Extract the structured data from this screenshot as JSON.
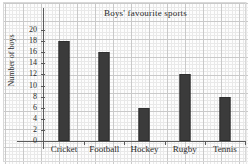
{
  "chart_data": {
    "type": "bar",
    "title": "Boys' favourite sports",
    "xlabel": "",
    "ylabel": "Number of boys",
    "categories": [
      "Cricket",
      "Football",
      "Hockey",
      "Rugby",
      "Tennis"
    ],
    "values": [
      18,
      16,
      6,
      12,
      8
    ],
    "ylim": [
      0,
      20
    ],
    "ytick_step": 2,
    "yticks": [
      0,
      2,
      4,
      6,
      8,
      10,
      12,
      14,
      16,
      18,
      20
    ],
    "ytick_labels": [
      "0",
      "2",
      "4",
      "6",
      "8",
      "10",
      "12",
      "14",
      "16",
      "18",
      "20"
    ],
    "grid": true,
    "grid_style": "graph-paper",
    "legend": false,
    "bar_color": "#3b3b3b",
    "axis_color": "#5a5a5a",
    "grid_color_major": "#c9c9c9",
    "grid_color_minor": "#e9e9e9",
    "background": "#fdfdfd",
    "series": [
      {
        "name": "Number of boys",
        "values": [
          18,
          16,
          6,
          12,
          8
        ]
      }
    ]
  }
}
